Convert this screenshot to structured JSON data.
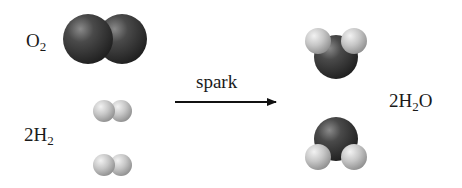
{
  "diagram": {
    "reactants": [
      {
        "id": "o2",
        "formula_main": "O",
        "formula_sub": "2",
        "coefficient": "",
        "molecule_count": 1,
        "atom_color": "#3a3a3a"
      },
      {
        "id": "h2",
        "formula_main": "H",
        "formula_sub": "2",
        "coefficient": "2",
        "molecule_count": 2,
        "atom_color": "#c8c8c8"
      }
    ],
    "arrow": {
      "label": "spark",
      "direction": "right"
    },
    "products": [
      {
        "id": "h2o",
        "coefficient": "2",
        "formula_main": "H",
        "formula_sub": "2",
        "formula_tail": "O",
        "molecule_count": 2
      }
    ],
    "colors": {
      "oxygen": "#3a3a3a",
      "hydrogen": "#cfcfcf",
      "text": "#1a1a1a"
    }
  }
}
